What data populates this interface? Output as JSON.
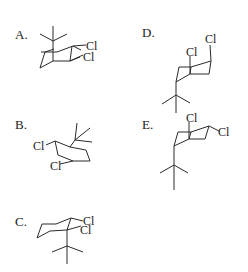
{
  "question": {
    "type": "multiple-choice",
    "subject": "chair conformations of tert-butyl dichlorocyclohexane"
  },
  "options": [
    {
      "label": "A.",
      "substituents": [
        "tert-butyl",
        "Cl",
        "Cl"
      ],
      "atom_labels": [
        "Cl",
        "Cl"
      ]
    },
    {
      "label": "B.",
      "substituents": [
        "tert-butyl",
        "Cl",
        "Cl"
      ],
      "atom_labels": [
        "Cl",
        "Cl"
      ]
    },
    {
      "label": "C.",
      "substituents": [
        "tert-butyl",
        "Cl",
        "Cl"
      ],
      "atom_labels": [
        "Cl",
        "Cl"
      ]
    },
    {
      "label": "D.",
      "substituents": [
        "tert-butyl",
        "Cl",
        "Cl"
      ],
      "atom_labels": [
        "Cl",
        "Cl"
      ]
    },
    {
      "label": "E.",
      "substituents": [
        "tert-butyl",
        "Cl",
        "Cl"
      ],
      "atom_labels": [
        "Cl",
        "Cl"
      ]
    }
  ],
  "colors": {
    "ink": "#2a2a2a",
    "background": "#ffffff"
  }
}
